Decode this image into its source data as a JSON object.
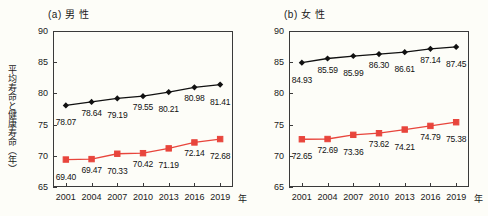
{
  "figure": {
    "background_color": "#fdfdf8",
    "axis_color": "#3a3a3a",
    "series_colors": {
      "life_expectancy": "#111111",
      "healthy_life_expectancy": "#e8453c"
    },
    "y_axis_label": "平均寿命と健康寿命（年）",
    "x_axis_unit": "年"
  },
  "chart_data": [
    {
      "type": "line",
      "title": "(a) 男  性",
      "panel_id": "a",
      "xlabel": "年",
      "ylabel": "平均寿命と健康寿命（年）",
      "x": [
        "2001",
        "2004",
        "2007",
        "2010",
        "2013",
        "2016",
        "2019"
      ],
      "xtick_labels": [
        "2001",
        "2004",
        "2007",
        "2010",
        "2013",
        "2016",
        "2019"
      ],
      "ytick_labels": [
        "65",
        "70",
        "75",
        "80",
        "85",
        "90"
      ],
      "ylim": [
        65,
        90
      ],
      "grid": false,
      "legend": "none",
      "series": [
        {
          "name": "平均寿命",
          "marker": "diamond",
          "color": "#111111",
          "values": [
            78.07,
            78.64,
            79.19,
            79.55,
            80.21,
            80.98,
            81.41
          ],
          "labels": [
            "78.07",
            "78.64",
            "79.19",
            "79.55",
            "80.21",
            "80.98",
            "81.41"
          ]
        },
        {
          "name": "健康寿命",
          "marker": "square",
          "color": "#e8453c",
          "values": [
            69.4,
            69.47,
            70.33,
            70.42,
            71.19,
            72.14,
            72.68
          ],
          "labels": [
            "69.40",
            "69.47",
            "70.33",
            "70.42",
            "71.19",
            "72.14",
            "72.68"
          ]
        }
      ]
    },
    {
      "type": "line",
      "title": "(b) 女  性",
      "panel_id": "b",
      "xlabel": "年",
      "ylabel": "平均寿命と健康寿命（年）",
      "x": [
        "2001",
        "2004",
        "2007",
        "2010",
        "2013",
        "2016",
        "2019"
      ],
      "xtick_labels": [
        "2001",
        "2004",
        "2007",
        "2010",
        "2013",
        "2016",
        "2019"
      ],
      "ytick_labels": [
        "65",
        "70",
        "75",
        "80",
        "85",
        "90"
      ],
      "ylim": [
        65,
        90
      ],
      "grid": false,
      "legend": "none",
      "series": [
        {
          "name": "平均寿命",
          "marker": "diamond",
          "color": "#111111",
          "values": [
            84.93,
            85.59,
            85.99,
            86.3,
            86.61,
            87.14,
            87.45
          ],
          "labels": [
            "84.93",
            "85.59",
            "85.99",
            "86.30",
            "86.61",
            "87.14",
            "87.45"
          ]
        },
        {
          "name": "健康寿命",
          "marker": "square",
          "color": "#e8453c",
          "values": [
            72.65,
            72.69,
            73.36,
            73.62,
            74.21,
            74.79,
            75.38
          ],
          "labels": [
            "72.65",
            "72.69",
            "73.36",
            "73.62",
            "74.21",
            "74.79",
            "75.38"
          ]
        }
      ]
    }
  ]
}
